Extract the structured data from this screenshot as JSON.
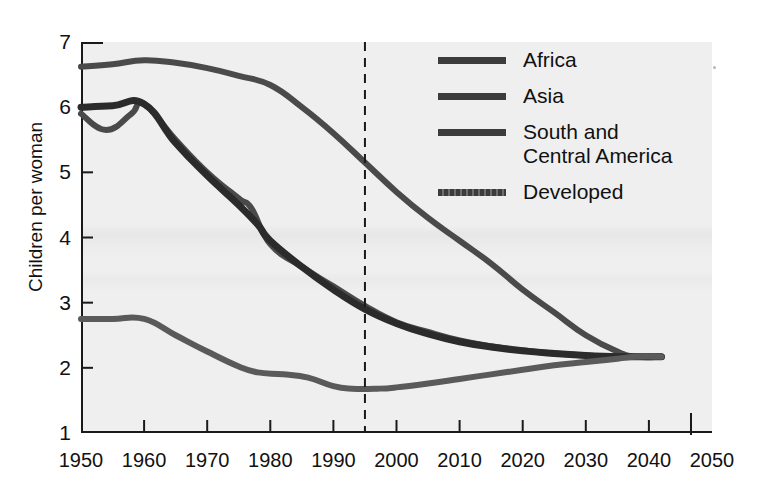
{
  "chart_data": {
    "type": "line",
    "title": "",
    "subtitle": "",
    "xlabel": "",
    "ylabel": "Children per woman",
    "xlim": [
      1950,
      2050
    ],
    "ylim": [
      1,
      7
    ],
    "grid": false,
    "legend_position": "top-right",
    "xticks": [
      "1950",
      "1960",
      "1970",
      "1980",
      "1990",
      "2000",
      "2010",
      "2020",
      "2030",
      "2040",
      "2050"
    ],
    "yticks": [
      "1",
      "2",
      "3",
      "4",
      "5",
      "6",
      "7"
    ],
    "annotations": [
      {
        "name": "projection-divider",
        "type": "vertical-dashed-line",
        "x": 1995,
        "label": ""
      }
    ],
    "series": [
      {
        "name": "Africa",
        "color": "#4a4a4a",
        "stroke_width": 6,
        "style": "solid",
        "x": [
          1950,
          1955,
          1960,
          1965,
          1970,
          1975,
          1980,
          1985,
          1990,
          1995,
          2000,
          2005,
          2010,
          2015,
          2020,
          2025,
          2030,
          2035,
          2038,
          2042
        ],
        "values": [
          6.62,
          6.66,
          6.72,
          6.68,
          6.6,
          6.48,
          6.34,
          6.0,
          5.6,
          5.15,
          4.7,
          4.3,
          3.95,
          3.6,
          3.2,
          2.85,
          2.5,
          2.25,
          2.17,
          2.17
        ]
      },
      {
        "name": "Asia",
        "color": "#4a4a4a",
        "stroke_width": 6,
        "style": "solid",
        "x": [
          1950,
          1954,
          1958,
          1960,
          1965,
          1970,
          1975,
          1977,
          1980,
          1985,
          1990,
          1995,
          2000,
          2005,
          2010,
          2015,
          2020,
          2025,
          2030,
          2035,
          2038,
          2042
        ],
        "values": [
          5.9,
          5.65,
          5.9,
          6.05,
          5.5,
          5.0,
          4.6,
          4.45,
          3.9,
          3.55,
          3.25,
          2.95,
          2.7,
          2.55,
          2.42,
          2.33,
          2.27,
          2.22,
          2.19,
          2.17,
          2.17,
          2.17
        ]
      },
      {
        "name": "South and\nCentral America",
        "color": "#2b2b2b",
        "stroke_width": 7,
        "style": "solid",
        "x": [
          1950,
          1955,
          1960,
          1965,
          1970,
          1975,
          1978,
          1980,
          1985,
          1990,
          1995,
          2000,
          2005,
          2010,
          2015,
          2020,
          2025,
          2030,
          2035,
          2038,
          2042
        ],
        "values": [
          6.0,
          6.02,
          6.05,
          5.45,
          4.95,
          4.5,
          4.2,
          3.95,
          3.55,
          3.2,
          2.9,
          2.68,
          2.52,
          2.4,
          2.32,
          2.26,
          2.22,
          2.19,
          2.17,
          2.17,
          2.17
        ]
      },
      {
        "name": "Developed",
        "color": "#5a5a5a",
        "stroke_width": 6,
        "style": "solid",
        "x": [
          1950,
          1955,
          1960,
          1965,
          1970,
          1975,
          1978,
          1982,
          1986,
          1990,
          1993,
          1997,
          2000,
          2005,
          2010,
          2015,
          2020,
          2025,
          2030,
          2035,
          2038,
          2042
        ],
        "values": [
          2.75,
          2.75,
          2.75,
          2.5,
          2.25,
          2.02,
          1.93,
          1.9,
          1.85,
          1.72,
          1.68,
          1.68,
          1.7,
          1.76,
          1.83,
          1.9,
          1.97,
          2.04,
          2.09,
          2.14,
          2.17,
          2.17
        ]
      }
    ]
  },
  "legend": {
    "items": [
      {
        "label": "Africa",
        "swatch": "solid"
      },
      {
        "label": "Asia",
        "swatch": "solid"
      },
      {
        "label": "South and\nCentral America",
        "swatch": "solid"
      },
      {
        "label": "Developed",
        "swatch": "dashed"
      }
    ]
  },
  "axes": {
    "y_title": "Children per woman",
    "y_ticks": [
      "7",
      "6",
      "5",
      "4",
      "3",
      "2",
      "1"
    ],
    "x_ticks": [
      "1950",
      "1960",
      "1970",
      "1980",
      "1990",
      "2000",
      "2010",
      "2020",
      "2030",
      "2040",
      "2050"
    ]
  },
  "colors": {
    "background": "#ffffff",
    "plot_background": "#efefef",
    "axis": "#1a1a1a",
    "text": "#111111",
    "series_light": "#5a5a5a",
    "series_mid": "#4a4a4a",
    "series_dark": "#2b2b2b"
  }
}
